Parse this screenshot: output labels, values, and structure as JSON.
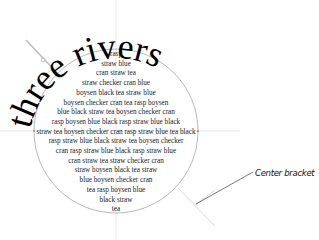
{
  "title": {
    "text": "three rivers"
  },
  "body_lines": [
    "rasp",
    "straw blue",
    "cran straw tea",
    "straw checker cran  blue",
    "boysen black tea  straw blue",
    "boysen checker cran tea rasp boysen",
    "blue black straw tea boysen checker cran",
    "rasp boysen blue black rasp straw blue black",
    "straw tea boysen checker cran rasp straw blue tea black",
    "rasp straw blue black straw tea boysen checker",
    "cran rasp straw blue black rasp straw blue",
    "cran straw tea straw checker cran",
    "straw boysen black tea  straw",
    "blue boysen checker cran",
    "tea rasp boysen blue",
    "black straw",
    "tea"
  ],
  "callout": {
    "label": "Center bracket"
  },
  "colors": {
    "text": "#1a1a1a",
    "guide": "#c8c8c8",
    "circle": "#9a9a9a",
    "leader": "#555555"
  }
}
